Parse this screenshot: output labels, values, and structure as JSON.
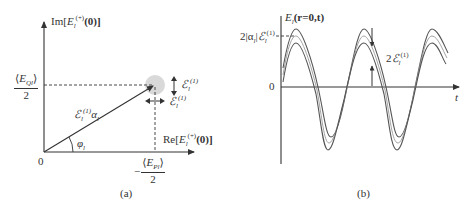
{
  "panel_a": {
    "caption": "(a)",
    "y_axis_label": "Im[E_l^(+)(0)]",
    "y_axis_label_parts": {
      "pre": "Im[",
      "sym": "E",
      "sup": "(+)",
      "sub": "l",
      "post": "(0)]"
    },
    "x_axis_label": "Re[E_l^(+)(0)]",
    "x_axis_label_parts": {
      "pre": "Re[",
      "sym": "E",
      "sup": "(+)",
      "sub": "l",
      "post": "(0)]"
    },
    "origin_label": "0",
    "y_tick": {
      "numerator": "⟨E_Ql⟩",
      "num_pre": "⟨",
      "num_sym": "E",
      "num_sub": "Ql",
      "num_post": "⟩",
      "denominator": "2"
    },
    "x_tick": {
      "sign": "−",
      "num_pre": "⟨",
      "num_sym": "E",
      "num_sub": "Pl",
      "num_post": "⟩",
      "denominator": "2"
    },
    "phasor_label": {
      "sym": "ℰ",
      "sup": "(1)",
      "sub": "l",
      "post": "α",
      "post_sub": "l"
    },
    "angle_label": {
      "sym": "φ",
      "sub": "l"
    },
    "vertical_uncertainty_label": {
      "sym": "ℰ",
      "sup": "(1)",
      "sub": "l"
    },
    "horizontal_uncertainty_label": {
      "sym": "ℰ",
      "sup": "(1)",
      "sub": "l"
    }
  },
  "panel_b": {
    "caption": "(b)",
    "y_axis_label": {
      "sym": "E",
      "sub": "l",
      "post": "(r=0,t)"
    },
    "x_axis_label": "t",
    "zero_label": "0",
    "amplitude_label": {
      "pre": "2|α",
      "pre_sub": "l",
      "mid": "|",
      "sym": "ℰ",
      "sup": "(1)",
      "sub": "l"
    },
    "noise_band_label": {
      "pre": "2",
      "sym": "ℰ",
      "sup": "(1)",
      "sub": "l"
    }
  },
  "colors": {
    "axis": "#333333",
    "curve_outer": "#555555",
    "curve_center": "#9a9a9a",
    "uncertainty_disk": "#d9d9d9"
  }
}
